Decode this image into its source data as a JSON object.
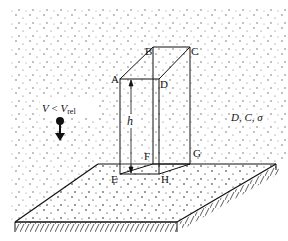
{
  "diagram": {
    "type": "physics-schematic",
    "vertex_labels": {
      "A": "A",
      "B": "B",
      "C": "C",
      "D": "D",
      "E": "E",
      "F": "F",
      "G": "G",
      "H": "H"
    },
    "height_label": "h",
    "velocity_label": {
      "V": "V",
      "relation": " < ",
      "Vrel_main": "V",
      "Vrel_sub": "rel"
    },
    "parameters_label": "D, C, σ",
    "colors": {
      "line": "#111111",
      "background": "#ffffff",
      "particles": "#555555"
    }
  }
}
